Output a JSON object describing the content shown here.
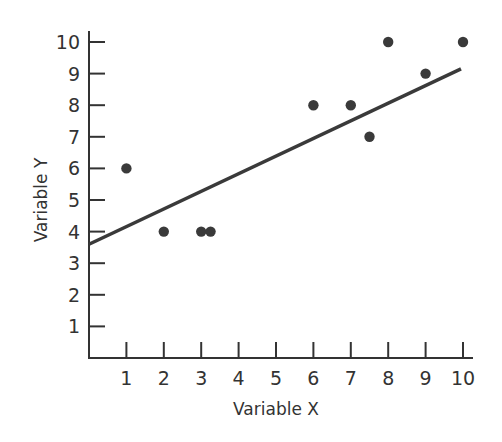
{
  "chart_data": {
    "type": "scatter",
    "title": "",
    "xlabel": "Variable X",
    "ylabel": "Variable Y",
    "xlim": [
      0,
      10
    ],
    "ylim": [
      0,
      10
    ],
    "x_ticks": [
      1,
      2,
      3,
      4,
      5,
      6,
      7,
      8,
      9,
      10
    ],
    "y_ticks": [
      1,
      2,
      3,
      4,
      5,
      6,
      7,
      8,
      9,
      10
    ],
    "grid": false,
    "legend": null,
    "series": [
      {
        "name": "observations",
        "type": "scatter",
        "points": [
          {
            "x": 1,
            "y": 6
          },
          {
            "x": 2,
            "y": 4
          },
          {
            "x": 3,
            "y": 4
          },
          {
            "x": 3.25,
            "y": 4
          },
          {
            "x": 6,
            "y": 8
          },
          {
            "x": 7,
            "y": 8
          },
          {
            "x": 7.5,
            "y": 7
          },
          {
            "x": 8,
            "y": 10
          },
          {
            "x": 9,
            "y": 9
          },
          {
            "x": 10,
            "y": 10
          }
        ]
      },
      {
        "name": "regression line",
        "type": "line",
        "points": [
          {
            "x": 0,
            "y": 3.6
          },
          {
            "x": 10,
            "y": 9.15
          }
        ]
      }
    ]
  },
  "colors": {
    "axis": "#333333",
    "points": "#3a3a3a",
    "line": "#3a3a3a"
  }
}
